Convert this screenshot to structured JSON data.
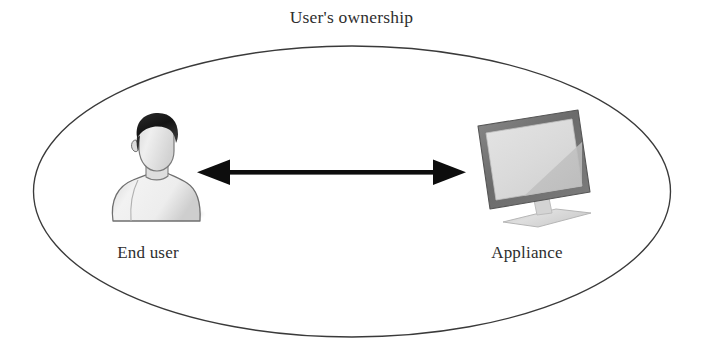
{
  "figure": {
    "title": "User's ownership",
    "background_color": "#ffffff",
    "boundary": {
      "shape": "ellipse",
      "stroke_color": "#3a3a3a",
      "fill": "none"
    }
  },
  "nodes": [
    {
      "id": "end-user",
      "label": "End user",
      "icon": "person-bust-icon",
      "icon_colors": {
        "hair": "#1f1f1f",
        "skin": "#e8e8e8",
        "body": "#ececec",
        "outline": "#6e6e6e",
        "shadow": "#cfcfcf"
      }
    },
    {
      "id": "appliance",
      "label": "Appliance",
      "icon": "monitor-icon",
      "icon_colors": {
        "bezel": "#6f6f6f",
        "screen": "#dcdcdc",
        "highlight": "#c4c4c4",
        "stand": "#d2d2d2",
        "base": "#d8d8d8"
      }
    }
  ],
  "connector": {
    "type": "double-headed-arrow",
    "from": "end-user",
    "to": "appliance",
    "color": "#0d0d0d"
  }
}
